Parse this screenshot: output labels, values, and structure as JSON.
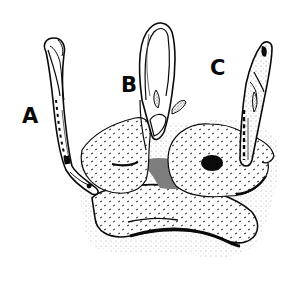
{
  "figure": {
    "labels": [
      {
        "id": "A",
        "text": "A"
      },
      {
        "id": "B",
        "text": "B"
      },
      {
        "id": "C",
        "text": "C"
      }
    ],
    "subjects": [
      {
        "label": "A",
        "posture": "body looped back, head resting on mound (left)"
      },
      {
        "label": "B",
        "posture": "body arched in a tall loop with fins visible (center)"
      },
      {
        "label": "C",
        "posture": "body extended upright out of mound (right)"
      }
    ],
    "colors": {
      "ink": "#0a0a0a",
      "paper": "#ffffff"
    }
  }
}
